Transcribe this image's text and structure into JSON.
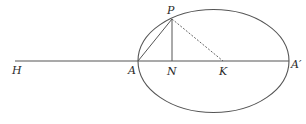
{
  "diagram": {
    "type": "geometry-ellipse",
    "colors": {
      "stroke": "#555555",
      "label": "#2a2a2a",
      "background": "#ffffff"
    },
    "ellipse": {
      "cx": 213.5,
      "cy": 61,
      "rx": 75.5,
      "ry": 51.5
    },
    "points": {
      "H": {
        "label": "H",
        "x": 15,
        "y": 61
      },
      "A": {
        "label": "A",
        "x": 138,
        "y": 61
      },
      "N": {
        "label": "N",
        "x": 172,
        "y": 61
      },
      "K": {
        "label": "K",
        "x": 223,
        "y": 61
      },
      "A_prime": {
        "label": "A′",
        "x": 289,
        "y": 61
      },
      "P": {
        "label": "P",
        "x": 172,
        "y": 19
      }
    },
    "segments": [
      {
        "from": "H",
        "to": "A_prime",
        "style": "solid"
      },
      {
        "from": "A",
        "to": "P",
        "style": "solid"
      },
      {
        "from": "P",
        "to": "N",
        "style": "solid"
      },
      {
        "from": "P",
        "to": "K",
        "style": "dashed"
      }
    ],
    "labels": {
      "H": "H",
      "A": "A",
      "N": "N",
      "K": "K",
      "A_prime": "A′",
      "P": "P"
    }
  }
}
